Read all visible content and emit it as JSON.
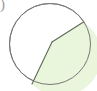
{
  "figure": {
    "type": "geometry-diagram",
    "background_color": "#ffffff",
    "canvas": {
      "width": 97,
      "height": 91
    }
  },
  "circle": {
    "label": "circle-outline",
    "center_x": 50,
    "center_y": 44,
    "radius": 40.5,
    "stroke_color": "#787878",
    "stroke_width": 1,
    "fill_color": "#ffffff"
  },
  "shaded_region": {
    "label": "shaded-sector",
    "fill_color": "#eaf6dc",
    "stroke_color": "#5c6a59",
    "stroke_width": 1.1,
    "vertex_interior": {
      "x": 52,
      "y": 42
    },
    "chord_upper_end": {
      "x": 83.5,
      "y": 22
    },
    "chord_lower_end": {
      "x": 32,
      "y": 84
    },
    "arc_sweep": "major-right",
    "path": "M 52 42 L 83.5 22 A 40.5 40.5 0 1 1 32 84 Z"
  },
  "chords": [
    {
      "label": "chord-upper",
      "from": {
        "x": 52,
        "y": 42
      },
      "to": {
        "x": 83.5,
        "y": 22
      },
      "stroke_color": "#5c6a59"
    },
    {
      "label": "chord-lower",
      "from": {
        "x": 52,
        "y": 42
      },
      "to": {
        "x": 32,
        "y": 84
      },
      "stroke_color": "#5c6a59"
    }
  ],
  "artifacts": {
    "corner_mark": {
      "label": "cropped-glyph-top-left",
      "text": ")",
      "color": "#9a9a9a"
    }
  }
}
